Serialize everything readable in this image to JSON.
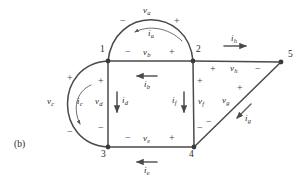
{
  "figure": {
    "panel_label": "(b)",
    "caption": "",
    "stroke_color": "#4a4a4a",
    "text_color": "#2b2b2b",
    "background": "#ffffff"
  },
  "nodes": [
    {
      "id": "1",
      "label": "1",
      "x": 108,
      "y": 61
    },
    {
      "id": "2",
      "label": "2",
      "x": 193,
      "y": 61
    },
    {
      "id": "3",
      "label": "3",
      "x": 108,
      "y": 147
    },
    {
      "id": "4",
      "label": "4",
      "x": 194,
      "y": 147
    },
    {
      "id": "5",
      "label": "5",
      "x": 281,
      "y": 62
    }
  ],
  "node_labels": [
    {
      "text": "1",
      "x": 100,
      "y": 49
    },
    {
      "text": "2",
      "x": 196,
      "y": 49
    },
    {
      "text": "3",
      "x": 101,
      "y": 151
    },
    {
      "text": "4",
      "x": 190,
      "y": 151
    },
    {
      "text": "5",
      "x": 288,
      "y": 53
    }
  ],
  "branches": [
    {
      "name": "branch-a",
      "voltage": "v",
      "voltage_sub": "a",
      "current": "i",
      "current_sub": "a",
      "shape": "arc-top",
      "from": "1",
      "to": "2",
      "polarity_left": "−",
      "polarity_right": "+"
    },
    {
      "name": "branch-b",
      "voltage": "v",
      "voltage_sub": "b",
      "current": "i",
      "current_sub": "b",
      "shape": "horizontal",
      "from": "1",
      "to": "2",
      "polarity_left": "−",
      "polarity_right": "+"
    },
    {
      "name": "branch-c",
      "voltage": "v",
      "voltage_sub": "c",
      "current": "i",
      "current_sub": "c",
      "shape": "arc-left",
      "from": "1",
      "to": "3",
      "polarity_top": "+",
      "polarity_bottom": "−"
    },
    {
      "name": "branch-d",
      "voltage": "v",
      "voltage_sub": "d",
      "current": "i",
      "current_sub": "d",
      "shape": "vertical",
      "from": "1",
      "to": "3",
      "polarity_top": "+",
      "polarity_bottom": "−"
    },
    {
      "name": "branch-e",
      "voltage": "v",
      "voltage_sub": "e",
      "current": "i",
      "current_sub": "e",
      "shape": "horizontal",
      "from": "3",
      "to": "4",
      "polarity_left": "−",
      "polarity_right": "+"
    },
    {
      "name": "branch-f",
      "voltage": "v",
      "voltage_sub": "f",
      "current": "i",
      "current_sub": "f",
      "shape": "vertical",
      "from": "2",
      "to": "4",
      "polarity_top": "+",
      "polarity_bottom": "−"
    },
    {
      "name": "branch-g",
      "voltage": "v",
      "voltage_sub": "g",
      "current": "i",
      "current_sub": "g",
      "shape": "diagonal",
      "from": "5",
      "to": "4",
      "polarity_top": "+",
      "polarity_bottom": "−"
    },
    {
      "name": "branch-h",
      "voltage": "v",
      "voltage_sub": "h",
      "current": "i",
      "current_sub": "h",
      "shape": "horizontal",
      "from": "2",
      "to": "5",
      "polarity_left": "+",
      "polarity_right": "−"
    }
  ],
  "labels": {
    "va": {
      "v": "v",
      "sub": "a",
      "x": 147,
      "y": 9
    },
    "ia": {
      "i": "i",
      "sub": "a",
      "x": 150,
      "y": 33
    },
    "vb": {
      "v": "v",
      "sub": "b",
      "x": 146,
      "y": 53
    },
    "ib": {
      "i": "i",
      "sub": "b",
      "x": 146,
      "y": 82
    },
    "vc": {
      "v": "v",
      "sub": "c",
      "x": 50,
      "y": 101
    },
    "ic": {
      "i": "i",
      "sub": "c",
      "x": 79,
      "y": 101
    },
    "vd": {
      "v": "v",
      "sub": "d",
      "x": 99,
      "y": 101
    },
    "id": {
      "i": "i",
      "sub": "d",
      "x": 124,
      "y": 100
    },
    "ve": {
      "v": "v",
      "sub": "e",
      "x": 146,
      "y": 139
    },
    "ie": {
      "i": "i",
      "sub": "e",
      "x": 146,
      "y": 168
    },
    "vf": {
      "v": "v",
      "sub": "f",
      "x": 199,
      "y": 101
    },
    "if": {
      "i": "i",
      "sub": "f",
      "x": 174,
      "y": 100
    },
    "vg": {
      "v": "v",
      "sub": "g",
      "x": 226,
      "y": 100
    },
    "ig": {
      "i": "i",
      "sub": "g",
      "x": 248,
      "y": 117
    },
    "vh": {
      "v": "v",
      "sub": "h",
      "x": 233,
      "y": 69
    },
    "ih": {
      "i": "i",
      "sub": "h",
      "x": 233,
      "y": 39
    }
  },
  "signs": [
    {
      "name": "sign-va-minus",
      "text": "−",
      "x": 122,
      "y": 21
    },
    {
      "name": "sign-va-plus",
      "text": "+",
      "x": 176,
      "y": 21
    },
    {
      "name": "sign-vb-minus",
      "text": "−",
      "x": 127,
      "y": 52
    },
    {
      "name": "sign-vb-plus",
      "text": "+",
      "x": 171,
      "y": 52
    },
    {
      "name": "sign-vc-plus",
      "text": "+",
      "x": 69,
      "y": 78
    },
    {
      "name": "sign-vc-minus",
      "text": "−",
      "x": 69,
      "y": 132
    },
    {
      "name": "sign-vd-plus",
      "text": "+",
      "x": 100,
      "y": 81
    },
    {
      "name": "sign-vd-minus",
      "text": "−",
      "x": 100,
      "y": 128
    },
    {
      "name": "sign-ve-minus",
      "text": "−",
      "x": 127,
      "y": 138
    },
    {
      "name": "sign-ve-plus",
      "text": "+",
      "x": 171,
      "y": 138
    },
    {
      "name": "sign-vf-plus",
      "text": "+",
      "x": 199,
      "y": 81
    },
    {
      "name": "sign-vf-minus",
      "text": "−",
      "x": 199,
      "y": 128
    },
    {
      "name": "sign-vg-plus",
      "text": "+",
      "x": 239,
      "y": 88
    },
    {
      "name": "sign-vg-minus",
      "text": "−",
      "x": 208,
      "y": 122
    },
    {
      "name": "sign-vh-plus",
      "text": "+",
      "x": 212,
      "y": 69
    },
    {
      "name": "sign-vh-minus",
      "text": "−",
      "x": 257,
      "y": 69
    }
  ]
}
